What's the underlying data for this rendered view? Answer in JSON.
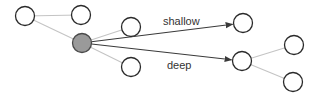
{
  "diagram": {
    "labels": {
      "shallow": "shallow",
      "deep": "deep"
    },
    "nodes": [
      {
        "id": "n1",
        "name": "node-top-left",
        "filled": false
      },
      {
        "id": "n2",
        "name": "node-top",
        "filled": false
      },
      {
        "id": "root",
        "name": "root-node",
        "filled": true
      },
      {
        "id": "n3",
        "name": "node-upper-child",
        "filled": false
      },
      {
        "id": "n4",
        "name": "node-lower-child",
        "filled": false
      },
      {
        "id": "s",
        "name": "shallow-node",
        "filled": false
      },
      {
        "id": "d",
        "name": "deep-node",
        "filled": false
      },
      {
        "id": "d1",
        "name": "deep-child-upper",
        "filled": false
      },
      {
        "id": "d2",
        "name": "deep-child-lower",
        "filled": false
      }
    ],
    "edges": [
      {
        "from": "n1",
        "to": "n2",
        "style": "light"
      },
      {
        "from": "n1",
        "to": "root",
        "style": "light"
      },
      {
        "from": "root",
        "to": "n3",
        "style": "light"
      },
      {
        "from": "root",
        "to": "n4",
        "style": "light"
      },
      {
        "from": "root",
        "to": "s",
        "style": "dark",
        "label": "shallow"
      },
      {
        "from": "root",
        "to": "d",
        "style": "dark",
        "label": "deep"
      },
      {
        "from": "d1",
        "to": "d",
        "style": "light"
      },
      {
        "from": "d",
        "to": "d2",
        "style": "light"
      }
    ],
    "colors": {
      "root_fill": "#9a9a9a",
      "light_edge": "#c4c4c4",
      "dark_edge": "#3a3a3a"
    }
  }
}
